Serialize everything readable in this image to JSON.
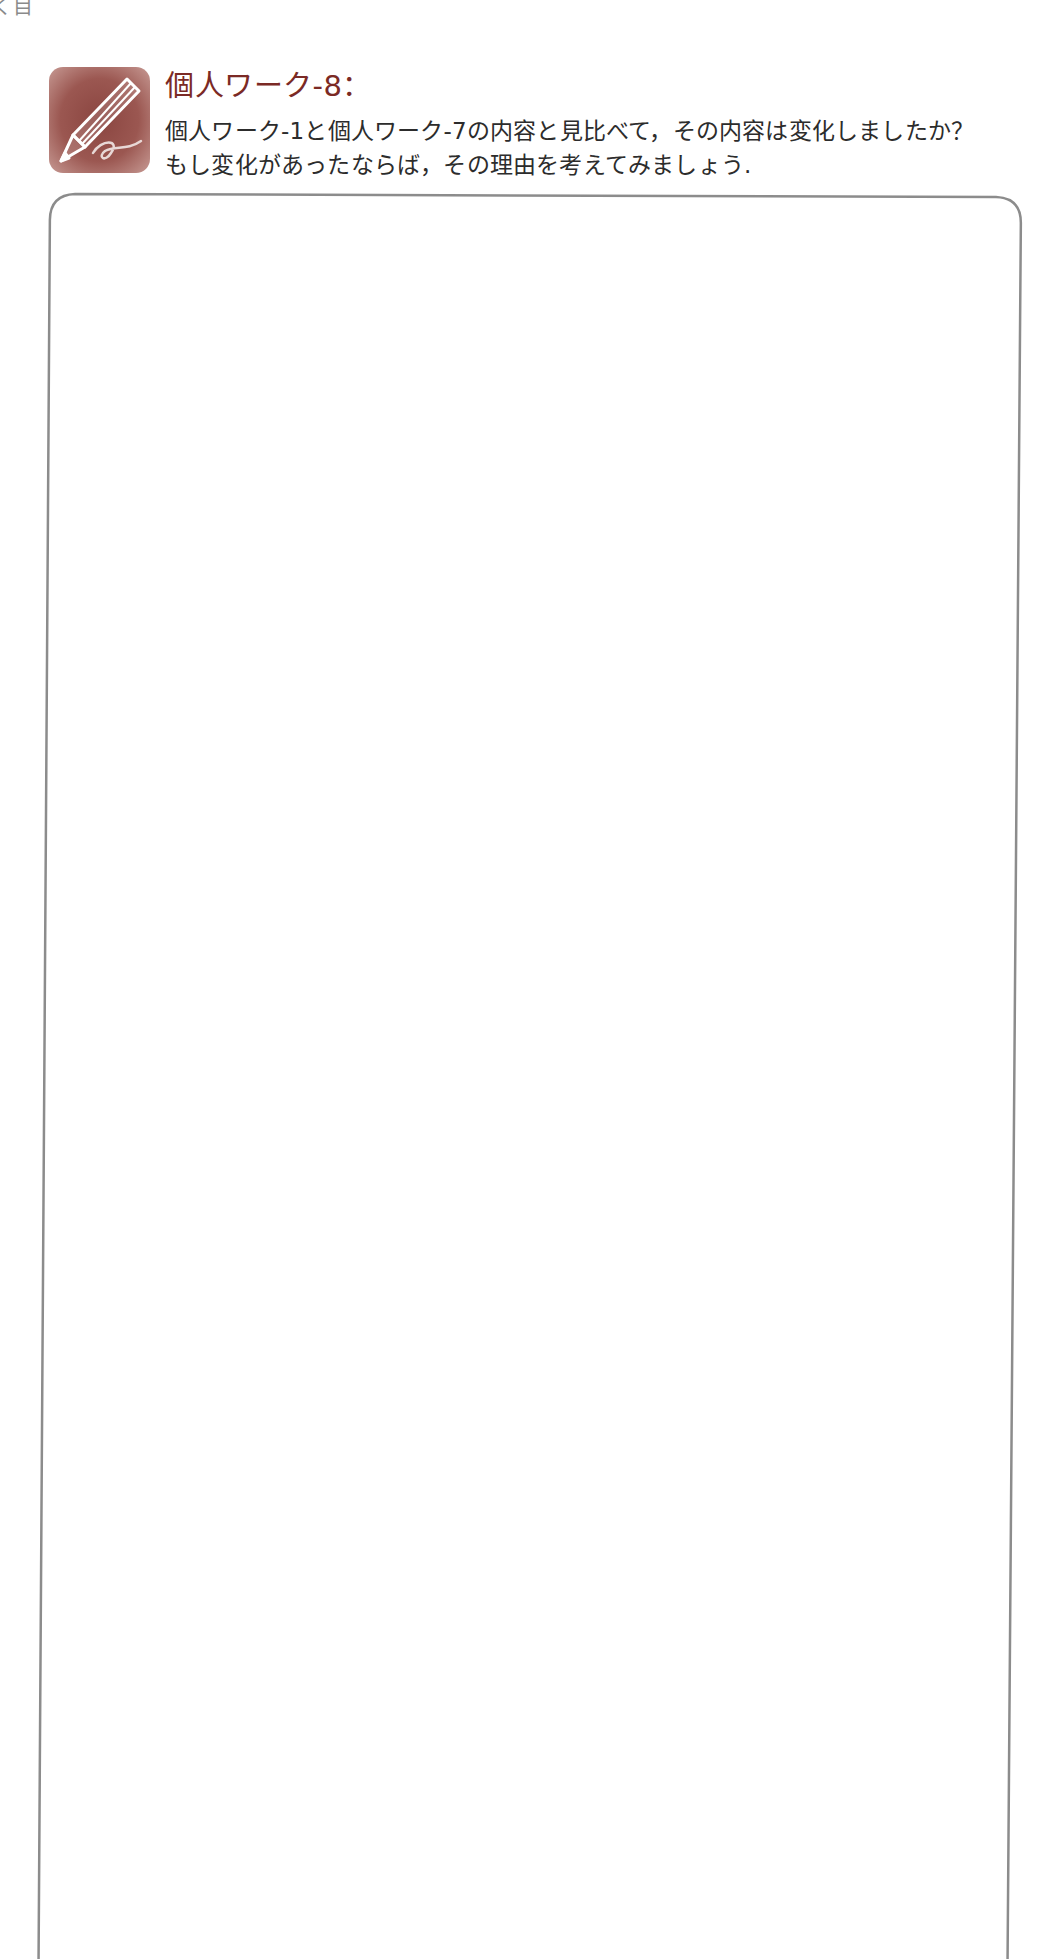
{
  "page": {
    "chapter_fragment": "く目"
  },
  "work": {
    "icon": "pencil-writing-icon",
    "title": "個人ワーク-8：",
    "prompt_lines": [
      "個人ワーク-1と個人ワーク-7の内容と見比べて，その内容は変化しましたか？",
      "もし変化があったならば，その理由を考えてみましょう."
    ]
  },
  "answer_box": {
    "value": "",
    "border_color": "#8c8c8c"
  },
  "colors": {
    "accent": "#7b2a25",
    "icon_bg": "#9b5751",
    "text": "#2c2c2c"
  }
}
